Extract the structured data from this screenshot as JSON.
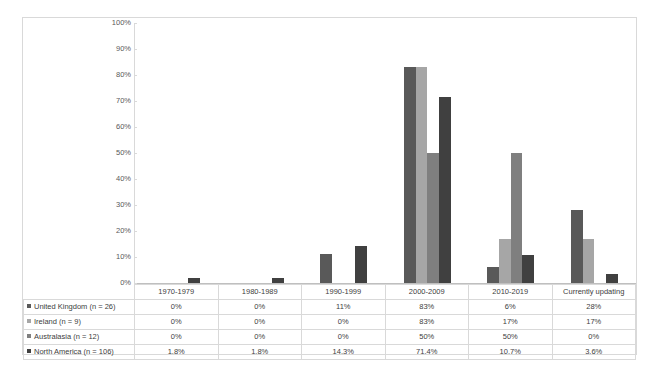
{
  "chart_data": {
    "type": "bar",
    "title": "",
    "xlabel": "",
    "ylabel": "",
    "ylim": [
      0,
      100
    ],
    "ytick_labels": [
      "100%",
      "90%",
      "80%",
      "70%",
      "60%",
      "50%",
      "40%",
      "30%",
      "20%",
      "10%",
      "0%"
    ],
    "ytick_values": [
      100,
      90,
      80,
      70,
      60,
      50,
      40,
      30,
      20,
      10,
      0
    ],
    "grid": false,
    "legend_position": "table-first-column",
    "categories": [
      "1970-1979",
      "1980-1989",
      "1990-1999",
      "2000-2009",
      "2010-2019",
      "Currently updating"
    ],
    "series": [
      {
        "name": "United Kingdom (n = 26)",
        "color": "#595959",
        "values": [
          0,
          0,
          11,
          83,
          6,
          28
        ],
        "labels": [
          "0%",
          "0%",
          "11%",
          "83%",
          "6%",
          "28%"
        ]
      },
      {
        "name": "Ireland (n = 9)",
        "color": "#a6a6a6",
        "values": [
          0,
          0,
          0,
          83,
          17,
          17
        ],
        "labels": [
          "0%",
          "0%",
          "0%",
          "83%",
          "17%",
          "17%"
        ]
      },
      {
        "name": "Australasia (n = 12)",
        "color": "#7f7f7f",
        "values": [
          0,
          0,
          0,
          50,
          50,
          0
        ],
        "labels": [
          "0%",
          "0%",
          "0%",
          "50%",
          "50%",
          "0%"
        ]
      },
      {
        "name": "North America (n = 106)",
        "color": "#404040",
        "values": [
          1.8,
          1.8,
          14.3,
          71.4,
          10.7,
          3.6
        ],
        "labels": [
          "1.8%",
          "1.8%",
          "14.3%",
          "71.4%",
          "10.7%",
          "3.6%"
        ]
      }
    ]
  },
  "table": {
    "corner_label": ""
  }
}
